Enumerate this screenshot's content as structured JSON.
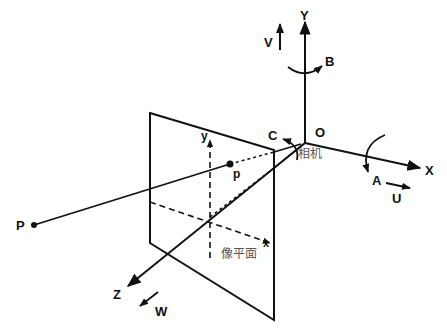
{
  "diagram": {
    "axes": {
      "X": "X",
      "Y": "Y",
      "Z": "Z",
      "origin": "O"
    },
    "image_plane_axes": {
      "x": "x",
      "y": "y"
    },
    "translations": {
      "U": "U",
      "V": "V",
      "W": "W"
    },
    "rotations": {
      "A": "A",
      "B": "B",
      "C": "C"
    },
    "points": {
      "world_point": "P",
      "image_point": "p"
    },
    "labels": {
      "camera": "相机",
      "image_plane": "像平面"
    },
    "colors": {
      "line": "#111111",
      "chinese_text": "#555555",
      "background": "#ffffff"
    }
  }
}
